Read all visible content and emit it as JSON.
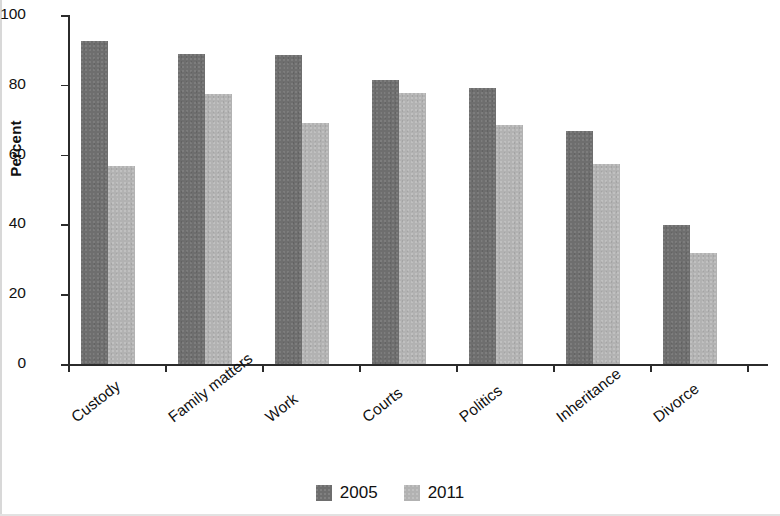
{
  "chart_data": {
    "type": "bar",
    "title": "",
    "xlabel": "",
    "ylabel": "Percent",
    "ylim": [
      0,
      100
    ],
    "yticks": [
      0,
      20,
      40,
      60,
      80,
      100
    ],
    "grid": false,
    "legend_position": "bottom-center",
    "categories": [
      "Custody",
      "Family matters",
      "Work",
      "Courts",
      "Politics",
      "Inheritance",
      "Divorce"
    ],
    "series": [
      {
        "name": "2005",
        "color": "#6e6e6e",
        "values": [
          92.5,
          88.8,
          88.6,
          81.4,
          79.0,
          66.7,
          39.9
        ]
      },
      {
        "name": "2011",
        "color": "#b2b2b2",
        "values": [
          56.7,
          77.5,
          69.2,
          77.6,
          68.4,
          57.3,
          31.9
        ]
      }
    ]
  },
  "axis": {
    "y_title": "Percent",
    "y_tick_labels": [
      "100",
      "80",
      "60",
      "40",
      "20",
      "0"
    ]
  },
  "legend": {
    "items": [
      {
        "label": "2005",
        "color": "#6e6e6e"
      },
      {
        "label": "2011",
        "color": "#b2b2b2"
      }
    ]
  }
}
